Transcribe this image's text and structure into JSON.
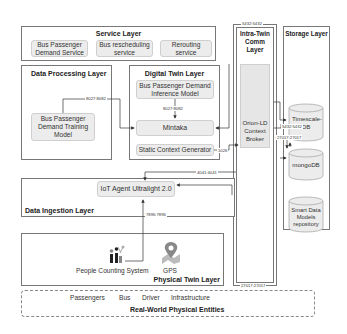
{
  "diagram": {
    "service_layer": {
      "title": "Service Layer",
      "components": [
        "Bus Passenger Demand Service",
        "Bus rescheduling service",
        "Rerouting service"
      ]
    },
    "data_processing_layer": {
      "title": "Data Processing Layer",
      "components": [
        "Bus Passenger Demand Training Model"
      ]
    },
    "digital_twin_layer": {
      "title": "Digital Twin Layer",
      "components": [
        "Bus Passenger Demand Inference Model",
        "Mintaka",
        "Static Context Generator"
      ]
    },
    "intra_twin_comm_layer": {
      "title": "Intra-Twin Comm Layer",
      "components": [
        "Orion-LD Context Broker"
      ]
    },
    "storage_layer": {
      "title": "Storage Layer",
      "components": [
        "Timescale-DB",
        "mongoDB",
        "Smart Data Models repository"
      ]
    },
    "data_ingestion_layer": {
      "title": "Data Ingestion Layer",
      "components": [
        "IoT Agent Ultralight 2.0"
      ]
    },
    "physical_twin_layer": {
      "title": "Physical Twin Layer",
      "components": [
        "People Counting System",
        "GPS"
      ]
    },
    "real_world_entities": {
      "title": "Real-World Physical Entities",
      "items": [
        "Passengers",
        "Bus",
        "Driver",
        "Infrastructure"
      ]
    },
    "ports": {
      "training_to_mintaka": "8027:8082",
      "inference_to_mintaka": "8027:8082",
      "comm_top": "5432:5432",
      "broker_to_timescale": "5432:5432",
      "broker_to_mongo": "27017:27017",
      "comm_bottom": "27017:27017",
      "static_context": "1026",
      "broker_to_iot_agent": "4041:4041",
      "iot_agent_to_sensors": "7896:7896"
    },
    "colors": {
      "component_fill": "#ececec",
      "border": "#777777"
    }
  }
}
